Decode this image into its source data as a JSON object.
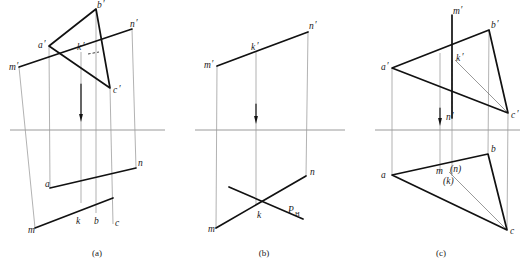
{
  "document": {
    "type": "descriptive-geometry-projection-plate",
    "figure_count": 3,
    "background_color": "#ffffff",
    "ink_color": "#111111",
    "ground_line_color": "#9a9a9a",
    "projector_color": "#7d7d7d"
  },
  "captions": [
    {
      "id": "caption-a",
      "text": "(a)",
      "x": 97,
      "y": 256
    },
    {
      "id": "caption-b",
      "text": "(b)",
      "x": 264,
      "y": 256
    },
    {
      "id": "caption-c",
      "text": "(c)",
      "x": 441,
      "y": 256
    }
  ],
  "figure_a": {
    "name": "figure-a",
    "ground_line": {
      "x1": 10,
      "y1": 130,
      "x2": 165,
      "y2": 130
    },
    "arrow": {
      "x": 81,
      "y_top": 84,
      "y_tip": 122
    },
    "triangle_front": {
      "label": "triangle-abc-front-view",
      "points": "49,46 96,9 110,88"
    },
    "line_front": {
      "label": "line-mn-front-view",
      "x1": 19,
      "y1": 67,
      "x2": 132,
      "y2": 29
    },
    "triangle_top": {
      "label": "triangle-abc-top-view",
      "x1": 50,
      "y1": 188,
      "x2": 136,
      "y2": 168
    },
    "line_top": {
      "label": "line-mn-top-view",
      "x1": 35,
      "y1": 228,
      "x2": 113,
      "y2": 198
    },
    "dash_mark": {
      "x1": 88,
      "y1": 54,
      "x2": 99,
      "y2": 52
    },
    "projectors": [
      {
        "x_top": 19,
        "y_top": 67,
        "x_bot": 35,
        "y_bot": 228
      },
      {
        "x_top": 49,
        "y_top": 46,
        "x_bot": 50,
        "y_bot": 188
      },
      {
        "x_top": 81,
        "y_top": 52,
        "x_bot": 81,
        "y_bot": 203
      },
      {
        "x_top": 96,
        "y_top": 9,
        "x_bot": 96,
        "y_bot": 213
      },
      {
        "x_top": 110,
        "y_top": 88,
        "x_bot": 113,
        "y_bot": 224
      },
      {
        "x_top": 132,
        "y_top": 29,
        "x_bot": 136,
        "y_bot": 168
      }
    ],
    "labels": [
      {
        "id": "label-b-prime",
        "text": "b",
        "prime": true,
        "x": 97,
        "y": 8
      },
      {
        "id": "label-n-prime",
        "text": "n",
        "prime": true,
        "x": 130,
        "y": 27
      },
      {
        "id": "label-a-prime",
        "text": "a",
        "prime": true,
        "x": 38,
        "y": 48
      },
      {
        "id": "label-k-prime",
        "text": "k",
        "prime": true,
        "x": 77,
        "y": 50
      },
      {
        "id": "label-m-prime",
        "text": "m",
        "prime": true,
        "x": 9,
        "y": 70
      },
      {
        "id": "label-c-prime",
        "text": "c",
        "prime": true,
        "x": 113,
        "y": 93
      },
      {
        "id": "label-n",
        "text": "n",
        "prime": false,
        "x": 138,
        "y": 166
      },
      {
        "id": "label-a",
        "text": "a",
        "prime": false,
        "x": 45,
        "y": 187
      },
      {
        "id": "label-k",
        "text": "k",
        "prime": false,
        "x": 76,
        "y": 224
      },
      {
        "id": "label-b",
        "text": "b",
        "prime": false,
        "x": 94,
        "y": 224
      },
      {
        "id": "label-c",
        "text": "c",
        "prime": false,
        "x": 115,
        "y": 226
      },
      {
        "id": "label-m",
        "text": "m",
        "prime": false,
        "x": 28,
        "y": 233
      }
    ]
  },
  "figure_b": {
    "name": "figure-b",
    "ground_line": {
      "x1": 195,
      "y1": 130,
      "x2": 345,
      "y2": 130
    },
    "arrow": {
      "x": 256,
      "y_top": 104,
      "y_tip": 124
    },
    "line_front": {
      "label": "line-mn-front-view",
      "x1": 217,
      "y1": 66,
      "x2": 308,
      "y2": 32
    },
    "line_top": {
      "label": "line-mn-top-view",
      "x1": 216,
      "y1": 228,
      "x2": 306,
      "y2": 176
    },
    "trace_line": {
      "label": "trace-plane-ph",
      "x1": 229,
      "y1": 187,
      "x2": 303,
      "y2": 219
    },
    "projectors": [
      {
        "x_top": 217,
        "y_top": 66,
        "x_bot": 216,
        "y_bot": 228
      },
      {
        "x_top": 256,
        "y_top": 51,
        "x_bot": 256,
        "y_bot": 204
      },
      {
        "x_top": 308,
        "y_top": 32,
        "x_bot": 306,
        "y_bot": 176
      }
    ],
    "labels": [
      {
        "id": "label-n-prime",
        "text": "n",
        "prime": true,
        "x": 309,
        "y": 29
      },
      {
        "id": "label-k-prime",
        "text": "k",
        "prime": true,
        "x": 251,
        "y": 50
      },
      {
        "id": "label-m-prime",
        "text": "m",
        "prime": true,
        "x": 204,
        "y": 68
      },
      {
        "id": "label-n",
        "text": "n",
        "prime": false,
        "x": 310,
        "y": 175
      },
      {
        "id": "label-k",
        "text": "k",
        "prime": false,
        "x": 257,
        "y": 218
      },
      {
        "id": "label-ph-main",
        "text": "P",
        "x": 288,
        "y": 213
      },
      {
        "id": "label-ph-sub",
        "text": "H",
        "x": 295,
        "y": 216
      },
      {
        "id": "label-m",
        "text": "m",
        "prime": false,
        "x": 208,
        "y": 232
      }
    ]
  },
  "figure_c": {
    "name": "figure-c",
    "ground_line": {
      "x1": 375,
      "y1": 130,
      "x2": 520,
      "y2": 130
    },
    "arrow": {
      "x": 440,
      "y_top": 108,
      "y_tip": 126
    },
    "triangle_front": {
      "label": "triangle-abc-front-view",
      "points": "392,68 489,30 508,113"
    },
    "line_front_vertical": {
      "label": "line-mn-front-view-vertical",
      "x": 452,
      "y1": 15,
      "y2": 118
    },
    "triangle_top": {
      "label": "triangle-abc-top-view",
      "points": "392,175 488,154 507,230"
    },
    "median_front": {
      "label": "median-a-to-c-front",
      "x1": 455,
      "y1": 60,
      "x2": 508,
      "y2": 113
    },
    "median_top": {
      "label": "median-m-to-c-top",
      "x1": 449,
      "y1": 172,
      "x2": 507,
      "y2": 230
    },
    "dashed_front": {
      "label": "hidden-segment-kn-front",
      "x": 452,
      "y1": 60,
      "y2": 112
    },
    "projectors": [
      {
        "x_top": 392,
        "y_top": 68,
        "x_bot": 392,
        "y_bot": 175
      },
      {
        "x_top": 440,
        "y_top": 53,
        "x_bot": 440,
        "y_bot": 172
      },
      {
        "x_top": 452,
        "y_top": 60,
        "x_bot": 452,
        "y_bot": 176
      },
      {
        "x_top": 489,
        "y_top": 30,
        "x_bot": 488,
        "y_bot": 154
      },
      {
        "x_top": 508,
        "y_top": 113,
        "x_bot": 507,
        "y_bot": 230
      }
    ],
    "labels": [
      {
        "id": "label-m-prime",
        "text": "m",
        "prime": true,
        "x": 453,
        "y": 14
      },
      {
        "id": "label-b-prime",
        "text": "b",
        "prime": true,
        "x": 491,
        "y": 28
      },
      {
        "id": "label-k-prime",
        "text": "k",
        "prime": true,
        "x": 456,
        "y": 61
      },
      {
        "id": "label-a-prime",
        "text": "a",
        "prime": true,
        "x": 381,
        "y": 70
      },
      {
        "id": "label-c-prime",
        "text": "c",
        "prime": true,
        "x": 511,
        "y": 118
      },
      {
        "id": "label-n-prime",
        "text": "n",
        "prime": true,
        "x": 446,
        "y": 120
      },
      {
        "id": "label-b",
        "text": "b",
        "prime": false,
        "x": 491,
        "y": 152
      },
      {
        "id": "label-a",
        "text": "a",
        "prime": false,
        "x": 381,
        "y": 178
      },
      {
        "id": "label-m-top",
        "text": "m",
        "prime": false,
        "x": 436,
        "y": 174
      },
      {
        "id": "label-n-paren",
        "text": "(n)",
        "x": 450,
        "y": 172
      },
      {
        "id": "label-k-paren",
        "text": "(k)",
        "x": 443,
        "y": 184
      },
      {
        "id": "label-c",
        "text": "c",
        "prime": false,
        "x": 510,
        "y": 234
      }
    ]
  }
}
